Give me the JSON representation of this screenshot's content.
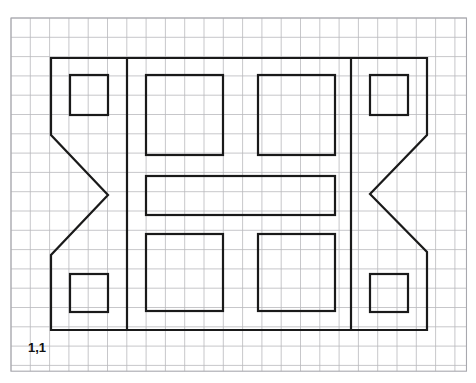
{
  "figure": {
    "canvas": {
      "width": 476,
      "height": 383,
      "background": "#ffffff"
    },
    "grid": {
      "origin_x": 11,
      "origin_y": 18,
      "cell_size": 19.3,
      "cols": 23.6,
      "rows": 18.3,
      "line_color": "#b9b9bd",
      "line_width": 0.8,
      "border_color": "#a8a8ae",
      "border_width": 1.1,
      "visible": true
    },
    "stroke": {
      "color": "#1a1a1a",
      "width": 2.2,
      "fill": "none",
      "linejoin": "miter"
    },
    "origin_label": {
      "text": "1,1",
      "x": 28,
      "y": 352,
      "font_size": 13,
      "bold": true,
      "color": "#111111"
    },
    "shapes": [
      {
        "name": "outer-notched-outline",
        "type": "polygon",
        "points": "51,58 351,58 427,58 427,135 370,194 427,252 427,330 127,330 51,330 51,255 108,195 51,135"
      },
      {
        "name": "left-vertical-divider",
        "type": "line",
        "points": "127,58 127,330"
      },
      {
        "name": "right-vertical-divider",
        "type": "line",
        "points": "351,58 351,330"
      },
      {
        "name": "small-square-top-left",
        "type": "rect",
        "x": 70,
        "y": 75,
        "width": 38,
        "height": 40
      },
      {
        "name": "small-square-bottom-left",
        "type": "rect",
        "x": 70,
        "y": 274,
        "width": 38,
        "height": 38
      },
      {
        "name": "small-square-top-right",
        "type": "rect",
        "x": 370,
        "y": 75,
        "width": 38,
        "height": 40
      },
      {
        "name": "small-square-bottom-right",
        "type": "rect",
        "x": 370,
        "y": 274,
        "width": 38,
        "height": 38
      },
      {
        "name": "large-square-top-left",
        "type": "rect",
        "x": 146,
        "y": 75,
        "width": 77,
        "height": 80
      },
      {
        "name": "large-square-top-right",
        "type": "rect",
        "x": 258,
        "y": 75,
        "width": 77,
        "height": 80
      },
      {
        "name": "middle-wide-rectangle",
        "type": "rect",
        "x": 146,
        "y": 176,
        "width": 189,
        "height": 39
      },
      {
        "name": "large-square-bottom-left",
        "type": "rect",
        "x": 146,
        "y": 234,
        "width": 77,
        "height": 77
      },
      {
        "name": "large-square-bottom-right",
        "type": "rect",
        "x": 258,
        "y": 234,
        "width": 77,
        "height": 77
      }
    ]
  },
  "chart_data": {
    "type": "table",
    "xlabel": "",
    "ylabel": "",
    "annotations": [
      "1,1"
    ]
  }
}
